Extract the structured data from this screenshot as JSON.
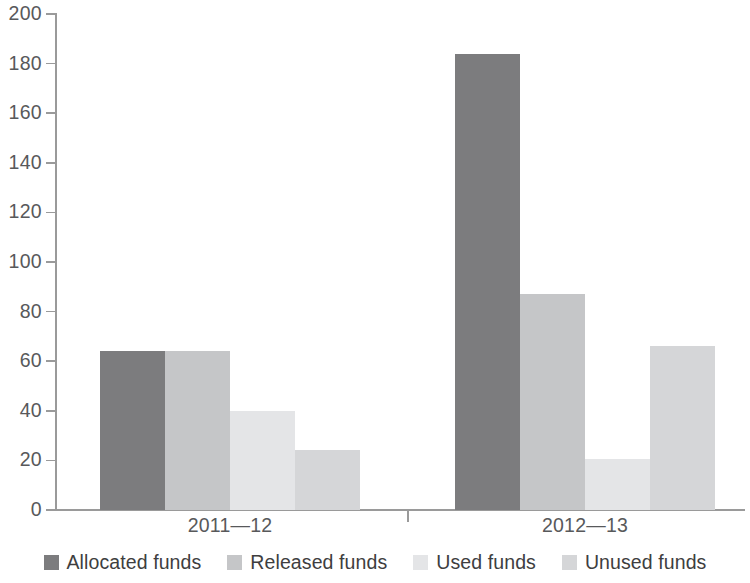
{
  "chart_data": {
    "type": "bar",
    "title": "",
    "subtitle": "",
    "xlabel": "",
    "ylabel": "",
    "categories": [
      "2011—12",
      "2012—13"
    ],
    "series": [
      {
        "name": "Allocated funds",
        "color": "#7c7c7e",
        "values": [
          64,
          184
        ]
      },
      {
        "name": "Released funds",
        "color": "#c5c6c8",
        "values": [
          64,
          87
        ]
      },
      {
        "name": "Used funds",
        "color": "#e4e5e7",
        "values": [
          40,
          20.5
        ]
      },
      {
        "name": "Unused funds",
        "color": "#d5d6d8",
        "values": [
          24,
          66
        ]
      }
    ],
    "ylim": [
      0,
      200
    ],
    "yticks": [
      0,
      20,
      40,
      60,
      80,
      100,
      120,
      140,
      160,
      180,
      200
    ],
    "ytick_labels": [
      "0",
      "20",
      "40",
      "60",
      "80",
      "100",
      "120",
      "140",
      "160",
      "180",
      "200"
    ],
    "grid": false,
    "legend_position": "bottom",
    "axis_color": "#9a9a9a",
    "text_color": "#58595b",
    "background": "#ffffff"
  }
}
